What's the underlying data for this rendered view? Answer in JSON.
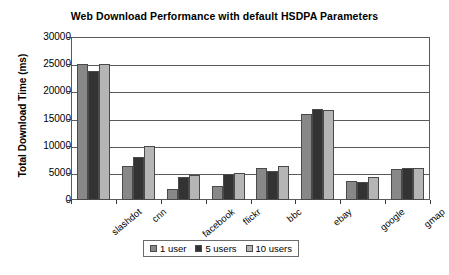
{
  "chart_data": {
    "type": "bar",
    "title": "Web Download Performance with default HSDPA Parameters",
    "xlabel": "",
    "ylabel": "Total Download Time (ms)",
    "ylim": [
      0,
      30000
    ],
    "ytick_values": [
      0,
      5000,
      10000,
      15000,
      20000,
      25000,
      30000
    ],
    "ytick_labels": [
      "0",
      "5000",
      "10000",
      "15000",
      "20000",
      "25000",
      "30000"
    ],
    "grid": true,
    "legend_position": "bottom",
    "categories": [
      "slashdot",
      "cnn",
      "facebook",
      "flickr",
      "bbc",
      "ebay",
      "google",
      "gmap"
    ],
    "series": [
      {
        "name": "1 user",
        "color": "#888888",
        "values": [
          25000,
          6300,
          2100,
          2500,
          5900,
          15800,
          3500,
          5700
        ]
      },
      {
        "name": "5 users",
        "color": "#333333",
        "values": [
          23800,
          8000,
          4200,
          4800,
          5400,
          16700,
          3400,
          5900
        ]
      },
      {
        "name": "10 users",
        "color": "#b5b5b5",
        "values": [
          25000,
          10000,
          4600,
          5000,
          6300,
          16600,
          4300,
          5900
        ]
      }
    ]
  }
}
